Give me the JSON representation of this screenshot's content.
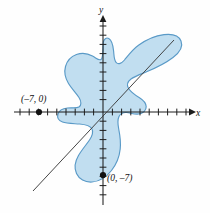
{
  "figure": {
    "type": "coordinate-plane-region-diagram",
    "background_color": "#fefefe",
    "region_fill_color": "#bedcef",
    "region_stroke_color": "#5a9ac7",
    "axis_color": "#1d1d1d",
    "line_color": "#3b3b3b"
  },
  "axes": {
    "x_label": "x",
    "y_label": "y",
    "origin_px": {
      "x": 103,
      "y": 112
    },
    "tick_spacing_px": 9.2,
    "x_axis_y_px": 112,
    "y_axis_x_px": 103,
    "x_range_px": {
      "start": 14,
      "end": 192
    },
    "y_range_px": {
      "start": 14,
      "end": 205
    },
    "x_tick_count_left": 9,
    "x_tick_count_right": 9,
    "y_tick_count_up": 10,
    "y_tick_count_down": 9,
    "arrows": [
      "x-positive",
      "y-positive"
    ]
  },
  "points": [
    {
      "id": "point-neg7-0",
      "label": "(–7, 0)",
      "px": {
        "x": 39,
        "y": 112
      },
      "label_px": {
        "x": 21,
        "y": 102
      }
    },
    {
      "id": "point-0-neg7",
      "label": "(0, –7)",
      "px": {
        "x": 103,
        "y": 175
      },
      "label_px": {
        "x": 107,
        "y": 181
      }
    }
  ],
  "secant_line": {
    "name": "line-through-points",
    "from_px": {
      "x": 33,
      "y": 191
    },
    "to_px": {
      "x": 174,
      "y": 40
    }
  },
  "region": {
    "name": "shaded-blob-region",
    "path": "M 103.5 41.5 C 104.5 38.5 106.5 37.2 108.8 38.6 C 111.4 40.1 113.0 45.0 113.6 51.0 C 114.1 56.4 114.0 60.5 116.3 62.6 C 118.4 64.6 121.5 63.5 124.5 60.0 C 128.0 55.8 132.5 49.6 138.5 45.3 C 146.0 39.8 155.5 35.6 164.0 34.6 C 172.5 33.6 179.0 36.0 181.0 41.0 C 183.2 46.4 180.0 52.2 173.0 57.5 C 165.5 63.2 155.0 68.3 146.0 72.0 C 139.0 74.9 134.0 76.8 131.0 79.0 C 127.5 81.6 126.5 85.0 128.6 88.5 C 130.8 92.2 135.0 95.0 139.5 97.8 C 143.3 100.2 146.0 103.0 146.2 106.5 C 146.4 110.5 143.0 113.5 138.5 114.0 C 134.2 114.5 130.0 112.8 126.6 112.5 C 123.2 112.2 120.5 113.5 119.0 116.5 C 117.2 120.1 117.8 124.5 118.8 129.5 C 119.9 135.0 121.0 141.5 120.2 149.0 C 119.4 156.8 116.2 164.5 111.5 170.5 C 106.5 176.9 99.5 181.5 92.0 182.0 C 85.0 182.5 79.0 179.0 76.5 173.5 C 74.0 168.0 75.0 161.5 78.5 155.5 C 82.0 149.5 86.5 144.5 89.5 140.0 C 92.3 135.8 93.5 132.0 92.0 129.0 C 90.3 125.7 85.5 124.5 79.5 124.0 C 73.0 123.5 66.5 123.5 62.5 122.0 C 58.5 120.5 57.0 117.5 58.0 114.0 C 59.0 110.5 62.5 108.5 67.5 108.0 C 72.0 107.5 76.5 108.5 79.0 107.0 C 81.5 105.5 81.5 101.5 79.0 97.5 C 76.2 93.0 71.5 88.5 68.5 83.5 C 65.2 78.0 64.0 72.0 65.5 66.5 C 67.0 61.0 71.0 56.5 76.5 54.5 C 82.0 52.5 88.0 53.5 92.5 56.0 C 96.5 58.2 99.0 61.0 101.0 59.5 C 102.8 58.1 102.8 53.0 103.0 48.5 C 103.1 45.5 103.1 43.0 103.5 41.5 Z"
  }
}
